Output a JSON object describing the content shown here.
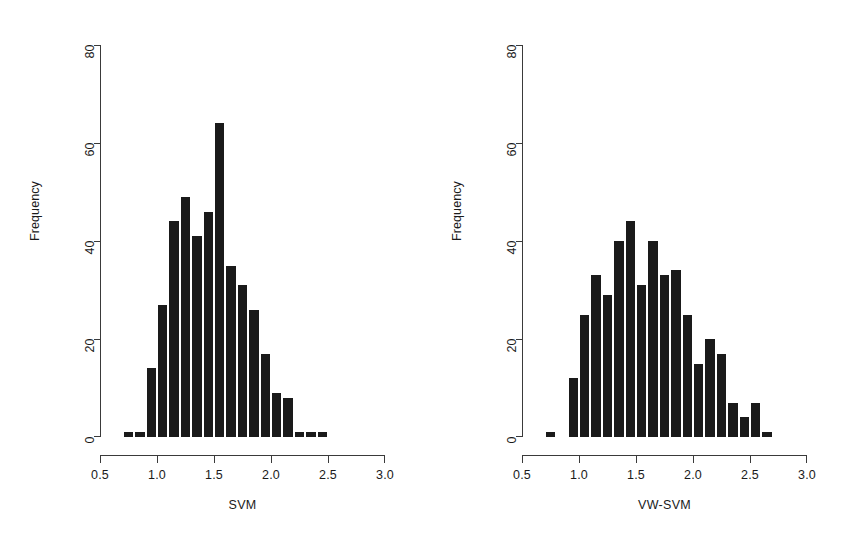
{
  "figure": {
    "background": "#ffffff",
    "ink_color": "#1a1a1a",
    "panel_count": 2
  },
  "chart_data": [
    {
      "type": "bar",
      "subtype": "histogram",
      "panel": "left",
      "title": "",
      "xlabel": "SVM",
      "ylabel": "Frequency",
      "xlim": [
        0.5,
        3.0
      ],
      "ylim": [
        0,
        80
      ],
      "xticks": [
        0.5,
        1.0,
        1.5,
        2.0,
        2.5,
        3.0
      ],
      "xtick_labels": [
        "0.5",
        "1.0",
        "1.5",
        "2.0",
        "2.5",
        "3.0"
      ],
      "yticks": [
        0,
        20,
        40,
        60,
        80
      ],
      "ytick_labels": [
        "0",
        "20",
        "40",
        "60",
        "80"
      ],
      "grid": false,
      "legend": null,
      "bin_width": 0.1,
      "bin_edges": [
        0.7,
        0.8,
        0.9,
        1.0,
        1.1,
        1.2,
        1.3,
        1.4,
        1.5,
        1.6,
        1.7,
        1.8,
        1.9,
        2.0,
        2.1,
        2.2,
        2.3,
        2.4,
        2.5
      ],
      "categories": [
        "0.7-0.8",
        "0.8-0.9",
        "0.9-1.0",
        "1.0-1.1",
        "1.1-1.2",
        "1.2-1.3",
        "1.3-1.4",
        "1.4-1.5",
        "1.5-1.6",
        "1.6-1.7",
        "1.7-1.8",
        "1.8-1.9",
        "1.9-2.0",
        "2.0-2.1",
        "2.1-2.2",
        "2.2-2.3",
        "2.3-2.4",
        "2.4-2.5"
      ],
      "values": [
        1,
        1,
        14,
        27,
        44,
        49,
        41,
        46,
        64,
        35,
        31,
        26,
        17,
        9,
        8,
        1,
        1,
        1
      ],
      "bar_color": "#1a1a1a"
    },
    {
      "type": "bar",
      "subtype": "histogram",
      "panel": "right",
      "title": "",
      "xlabel": "VW-SVM",
      "ylabel": "Frequency",
      "xlim": [
        0.5,
        3.0
      ],
      "ylim": [
        0,
        80
      ],
      "xticks": [
        0.5,
        1.0,
        1.5,
        2.0,
        2.5,
        3.0
      ],
      "xtick_labels": [
        "0.5",
        "1.0",
        "1.5",
        "2.0",
        "2.5",
        "3.0"
      ],
      "yticks": [
        0,
        20,
        40,
        60,
        80
      ],
      "ytick_labels": [
        "0",
        "20",
        "40",
        "60",
        "80"
      ],
      "grid": false,
      "legend": null,
      "bin_width": 0.1,
      "bin_edges": [
        0.7,
        0.8,
        0.9,
        1.0,
        1.1,
        1.2,
        1.3,
        1.4,
        1.5,
        1.6,
        1.7,
        1.8,
        1.9,
        2.0,
        2.1,
        2.2,
        2.3,
        2.4,
        2.5,
        2.6,
        2.7
      ],
      "categories": [
        "0.7-0.8",
        "0.8-0.9",
        "0.9-1.0",
        "1.0-1.1",
        "1.1-1.2",
        "1.2-1.3",
        "1.3-1.4",
        "1.4-1.5",
        "1.5-1.6",
        "1.6-1.7",
        "1.7-1.8",
        "1.8-1.9",
        "1.9-2.0",
        "2.0-2.1",
        "2.1-2.2",
        "2.2-2.3",
        "2.3-2.4",
        "2.4-2.5",
        "2.5-2.6",
        "2.6-2.7"
      ],
      "values": [
        1,
        0,
        12,
        25,
        33,
        29,
        40,
        44,
        31,
        40,
        33,
        34,
        25,
        15,
        20,
        17,
        7,
        4,
        7,
        1
      ],
      "bar_color": "#1a1a1a"
    }
  ]
}
